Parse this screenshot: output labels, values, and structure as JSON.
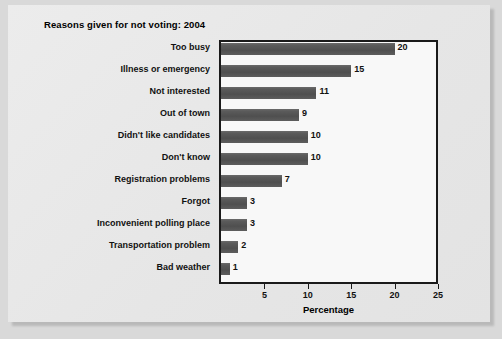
{
  "figure": {
    "title": "Reasons given for not voting: 2004",
    "background_color": "#d9d9d9",
    "card_color": "#e9e9e9",
    "plot_background": "#f8f8f8",
    "bar_color": "#5a5a5a",
    "axis_color": "#1a1a1a"
  },
  "chart_data": {
    "type": "bar",
    "orientation": "horizontal",
    "title": "Reasons given for not voting: 2004",
    "xlabel": "Percentage",
    "ylabel": "",
    "xlim": [
      0,
      25
    ],
    "xticks": [
      5,
      10,
      15,
      20,
      25
    ],
    "xticklabels": [
      "5",
      "10",
      "15",
      "20",
      "25"
    ],
    "grid": false,
    "legend": false,
    "categories": [
      "Too busy",
      "Illness or emergency",
      "Not interested",
      "Out of town",
      "Didn't like candidates",
      "Don't know",
      "Registration problems",
      "Forgot",
      "Inconvenient polling place",
      "Transportation problem",
      "Bad weather"
    ],
    "values": [
      20,
      15,
      11,
      9,
      10,
      10,
      7,
      3,
      3,
      2,
      1
    ],
    "value_labels": [
      "20",
      "15",
      "11",
      "9",
      "10",
      "10",
      "7",
      "3",
      "3",
      "2",
      "1"
    ]
  }
}
